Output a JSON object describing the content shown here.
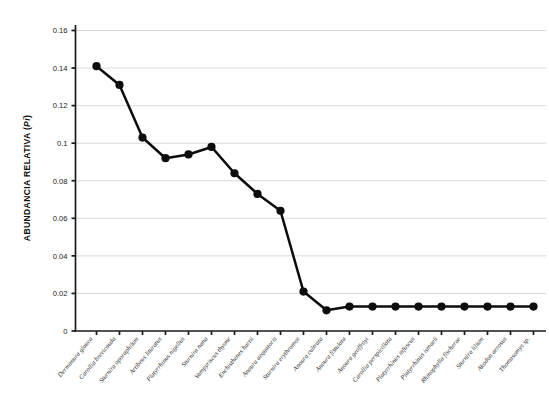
{
  "chart_data": {
    "type": "line",
    "title": "",
    "xlabel": "",
    "ylabel": "ABUNDANCIA RELATIVA (Pi)",
    "ylabel_plain": "ABUNDANCIA RELATIVA (",
    "ylabel_italic": "Pi",
    "ylabel_tail": ")",
    "ylim": [
      0,
      0.16
    ],
    "ytick_values": [
      0,
      0.02,
      0.04,
      0.06,
      0.08,
      0.1,
      0.12,
      0.14,
      0.16
    ],
    "ytick_labels": [
      "0",
      "0.02",
      "0.04",
      "0.06",
      "0.08",
      "0.1",
      "0.12",
      "0.14",
      "0.16"
    ],
    "grid": "horizontal",
    "legend": "none",
    "marker": "filled-circle",
    "line_color": "#0d0d0d",
    "grid_color": "#c9c9c9",
    "axis_color": "#1a1a1a",
    "categories": [
      "Dermanura glauca",
      "Carollia brevicauda",
      "Sturnira oporaphilum",
      "Artibeus lituratus",
      "Platyrrhinus nigellus",
      "Sturnira nana",
      "Vampyriscus thyone",
      "Enchisthenes hartii",
      "Anoura aequatoris",
      "Sturnira erythromos",
      "Anoura cultrata",
      "Anoura fistulata",
      "Anoura geoffroyi",
      "Carollia perspicillata",
      "Platyrrhinus infuscus",
      "Platyrrhinus ismaeli",
      "Rhinophylla fischerae",
      "Sturnira lilium",
      "Akodon aerosus",
      "Thomasomys sp."
    ],
    "values": [
      0.141,
      0.131,
      0.103,
      0.092,
      0.094,
      0.098,
      0.084,
      0.073,
      0.064,
      0.021,
      0.011,
      0.013,
      0.013,
      0.013,
      0.013,
      0.013,
      0.013,
      0.013,
      0.013,
      0.013
    ]
  }
}
